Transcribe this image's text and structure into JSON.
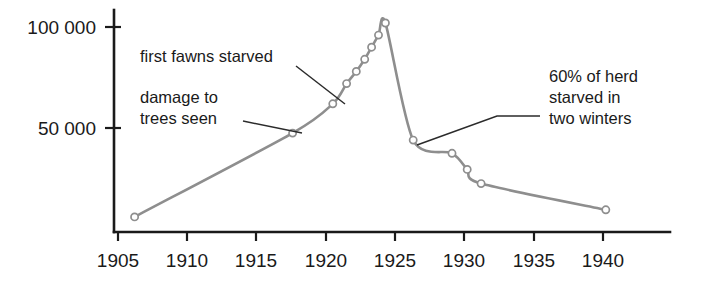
{
  "chart_data": {
    "type": "line",
    "title": "",
    "subtitle": "",
    "xlabel": "",
    "ylabel": "",
    "xlim": [
      1905,
      1941
    ],
    "ylim": [
      0,
      110000
    ],
    "grid": false,
    "legend_position": "none",
    "x_ticks": [
      "1905",
      "1910",
      "1915",
      "1920",
      "1925",
      "1930",
      "1935",
      "1940"
    ],
    "x_tick_values": [
      1905,
      1910,
      1915,
      1920,
      1925,
      1930,
      1935,
      1940
    ],
    "y_ticks": [
      "50 000",
      "100 000"
    ],
    "y_tick_values": [
      50000,
      100000
    ],
    "series": [
      {
        "name": "Kaibab deer herd population",
        "color": "#8e8e8e",
        "marker": "open-circle",
        "x": [
          1906.2,
          1917.6,
          1920.5,
          1921.5,
          1922.2,
          1922.8,
          1923.3,
          1923.8,
          1924.3,
          1926.3,
          1929.1,
          1930.2,
          1931.2,
          1940.2
        ],
        "y": [
          6000,
          47500,
          62000,
          72000,
          78000,
          84000,
          90000,
          96000,
          102000,
          44000,
          37500,
          29500,
          22500,
          9500
        ],
        "points": [
          {
            "x": 1906.2,
            "y": 6000
          },
          {
            "x": 1917.6,
            "y": 47500
          },
          {
            "x": 1920.5,
            "y": 62000
          },
          {
            "x": 1921.5,
            "y": 72000
          },
          {
            "x": 1922.2,
            "y": 78000
          },
          {
            "x": 1922.8,
            "y": 84000
          },
          {
            "x": 1923.3,
            "y": 90000
          },
          {
            "x": 1923.8,
            "y": 96000
          },
          {
            "x": 1924.3,
            "y": 102000
          },
          {
            "x": 1926.3,
            "y": 44000
          },
          {
            "x": 1929.1,
            "y": 37500
          },
          {
            "x": 1930.2,
            "y": 29500
          },
          {
            "x": 1931.2,
            "y": 22500
          },
          {
            "x": 1940.2,
            "y": 9500
          }
        ]
      }
    ],
    "annotations": [
      {
        "id": "first-fawns-starved",
        "lines": [
          "first fawns starved"
        ],
        "target_x": 1922.0,
        "target_y": 78000
      },
      {
        "id": "damage-to-trees-seen",
        "lines": [
          "damage to",
          "trees seen"
        ],
        "target_x": 1917.6,
        "target_y": 47500
      },
      {
        "id": "sixty-percent-starved",
        "lines": [
          "60% of herd",
          "starved in",
          "two winters"
        ],
        "target_x": 1925.2,
        "target_y": 68000
      }
    ]
  },
  "annotation_text": {
    "first_fawns": "first fawns starved",
    "damage_line1": "damage to",
    "damage_line2": "trees seen",
    "herd_line1": "60% of herd",
    "herd_line2": "starved in",
    "herd_line3": "two winters"
  },
  "axis": {
    "y_top_label": "100 000",
    "y_mid_label": "50 000",
    "x_labels": [
      "1905",
      "1910",
      "1915",
      "1920",
      "1925",
      "1930",
      "1935",
      "1940"
    ]
  },
  "colors": {
    "curve": "#8e8e8e",
    "axis": "#1a1a1a",
    "text": "#1a1a1a",
    "leader": "#2b2b2b",
    "background": "#ffffff"
  }
}
